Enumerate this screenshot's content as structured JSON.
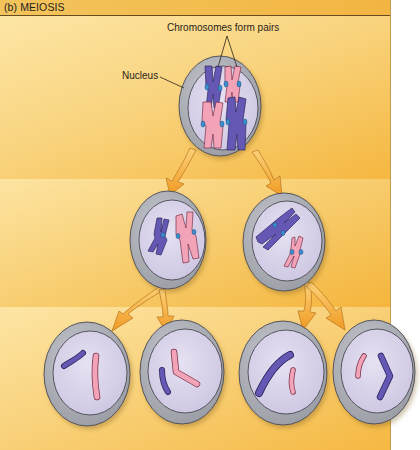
{
  "header": {
    "title": "(b) MEIOSIS"
  },
  "labels": {
    "chromosomes_pair": "Chromosomes form pairs",
    "nucleus": "Nucleus"
  },
  "colors": {
    "band_pale": "#fde6a6",
    "band_deep": "#f5b740",
    "header": "#f2b542",
    "cell_outer": "#a9acb3",
    "nucleus_fill": "#d9d3ea",
    "chromosome_blue": "#6458b4",
    "chromosome_pink": "#f2a3b8",
    "centromere": "#3b8fd0",
    "arrow": "#f3a532"
  },
  "stages": [
    {
      "name": "parent-cell",
      "cells": 1,
      "chromosome_pairs": 2
    },
    {
      "name": "meiosis-I-daughters",
      "cells": 2,
      "chromosomes_per_cell": 2
    },
    {
      "name": "meiosis-II-daughters",
      "cells": 4,
      "chromosomes_per_cell": 2
    }
  ]
}
